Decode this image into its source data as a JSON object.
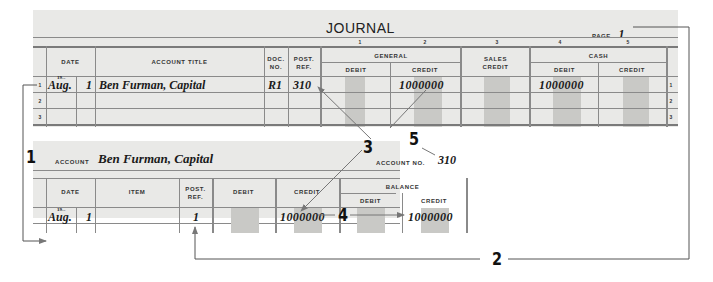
{
  "journal": {
    "title": "JOURNAL",
    "page_label": "PAGE",
    "page_number": "1",
    "column_numbers": [
      "1",
      "2",
      "3",
      "4",
      "5"
    ],
    "headers": {
      "date": "DATE",
      "account_title": "ACCOUNT TITLE",
      "doc_no_1": "DOC.",
      "doc_no_2": "NO.",
      "post_ref_1": "POST.",
      "post_ref_2": "REF.",
      "general": "GENERAL",
      "general_debit": "DEBIT",
      "general_credit": "CREDIT",
      "sales_credit_1": "SALES",
      "sales_credit_2": "CREDIT",
      "cash": "CASH",
      "cash_debit": "DEBIT",
      "cash_credit": "CREDIT"
    },
    "row_numbers": [
      "1",
      "2",
      "3"
    ],
    "rows": [
      {
        "year": "19--",
        "month": "Aug.",
        "day": "1",
        "account_title": "Ben Furman, Capital",
        "doc_no": "R1",
        "post_ref": "310",
        "general_debit": "",
        "general_credit": "10000 00",
        "general_credit_dollars": "10000",
        "general_credit_cents": "00",
        "sales_credit": "",
        "cash_debit": "10000 00",
        "cash_debit_dollars": "10000",
        "cash_debit_cents": "00",
        "cash_credit": ""
      }
    ]
  },
  "ledger": {
    "account_label": "ACCOUNT",
    "account_name": "Ben Furman, Capital",
    "account_no_label": "ACCOUNT NO.",
    "account_no": "310",
    "headers": {
      "date": "DATE",
      "item": "ITEM",
      "post_ref_1": "POST.",
      "post_ref_2": "REF.",
      "debit": "DEBIT",
      "credit": "CREDIT",
      "balance": "BALANCE",
      "balance_debit": "DEBIT",
      "balance_credit": "CREDIT"
    },
    "rows": [
      {
        "year": "19--",
        "month": "Aug.",
        "day": "1",
        "item": "",
        "post_ref": "1",
        "debit": "",
        "credit_dollars": "10000",
        "credit_cents": "00",
        "balance_debit": "",
        "balance_credit_dollars": "10000",
        "balance_credit_cents": "00"
      }
    ]
  },
  "callouts": [
    "1",
    "2",
    "3",
    "4",
    "5"
  ]
}
